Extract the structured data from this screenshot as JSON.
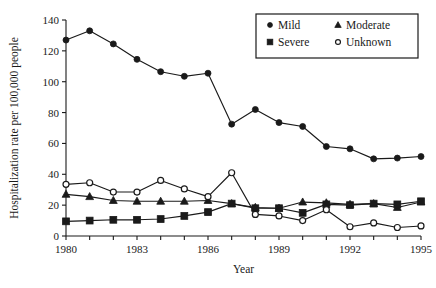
{
  "chart_data": {
    "type": "line",
    "title": "",
    "xlabel": "Year",
    "ylabel": "Hospitalization rate per 100,000 people",
    "xlim": [
      1980,
      1995
    ],
    "ylim": [
      0,
      140
    ],
    "ytick_values": [
      0,
      20,
      40,
      60,
      80,
      100,
      120,
      140
    ],
    "ytick_labels": [
      "0",
      "20",
      "40",
      "60",
      "80",
      "100",
      "120",
      "140"
    ],
    "xtick_values": [
      1980,
      1981,
      1982,
      1983,
      1984,
      1985,
      1986,
      1987,
      1988,
      1989,
      1990,
      1991,
      1992,
      1993,
      1994,
      1995
    ],
    "xtick_labeled": [
      1980,
      1983,
      1986,
      1989,
      1992,
      1995
    ],
    "xtick_labels": [
      "1980",
      "1983",
      "1986",
      "1989",
      "1992",
      "1995"
    ],
    "grid": false,
    "legend_position": "top-right",
    "x": [
      1980,
      1981,
      1982,
      1983,
      1984,
      1985,
      1986,
      1987,
      1988,
      1989,
      1990,
      1991,
      1992,
      1993,
      1994,
      1995
    ],
    "series": [
      {
        "name": "Mild",
        "marker": "filled-circle",
        "values": [
          127,
          133,
          124.5,
          114.5,
          106.5,
          103.5,
          105.5,
          72.5,
          82,
          73.5,
          71,
          58,
          56.5,
          50,
          50.5,
          51.5
        ]
      },
      {
        "name": "Moderate",
        "marker": "filled-triangle",
        "values": [
          27,
          25.5,
          23,
          22.5,
          22.5,
          22.5,
          23,
          21,
          18.5,
          18,
          22,
          21.5,
          20.5,
          21,
          18.5,
          22
        ]
      },
      {
        "name": "Severe",
        "marker": "filled-square",
        "values": [
          9.5,
          10,
          10.5,
          10.5,
          11,
          13,
          15.5,
          21,
          18,
          18,
          15,
          20.5,
          20,
          21,
          20.5,
          22.5
        ]
      },
      {
        "name": "Unknown",
        "marker": "open-circle",
        "values": [
          33.5,
          34.5,
          28.5,
          28.5,
          36,
          30.5,
          25.5,
          41,
          14,
          13,
          10,
          17,
          6,
          8.5,
          5.5,
          6.5
        ]
      }
    ]
  },
  "legend": {
    "entries": [
      {
        "label": "Mild",
        "marker": "filled-circle"
      },
      {
        "label": "Moderate",
        "marker": "filled-triangle"
      },
      {
        "label": "Severe",
        "marker": "filled-square"
      },
      {
        "label": "Unknown",
        "marker": "open-circle"
      }
    ]
  },
  "colors": {
    "ink": "#1a1a1a",
    "background": "#ffffff"
  }
}
